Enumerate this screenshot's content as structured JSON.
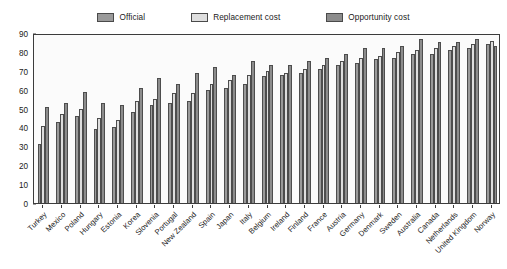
{
  "legend": {
    "position": "top-center",
    "items": [
      {
        "label": "Official",
        "color": "#9a9a9a",
        "key": "official"
      },
      {
        "label": "Replacement cost",
        "color": "#dedede",
        "key": "replacement_cost"
      },
      {
        "label": "Opportunity cost",
        "color": "#8c8c8c",
        "key": "opportunity_cost"
      }
    ]
  },
  "axes": {
    "y_ticks": [
      "0",
      "10",
      "20",
      "30",
      "40",
      "50",
      "60",
      "70",
      "80",
      "90"
    ],
    "y_min": 0,
    "y_max": 90,
    "y_step": 10,
    "grid": false
  },
  "chart_data": {
    "type": "bar",
    "title": "",
    "subtitle": "",
    "xlabel": "",
    "ylabel": "",
    "ylim": [
      0,
      90
    ],
    "grid": false,
    "legend_position": "top-center",
    "categories": [
      "Turkey",
      "Mexico",
      "Poland",
      "Hungary",
      "Estonia",
      "Korea",
      "Slovenia",
      "Portugal",
      "New Zealand",
      "Spain",
      "Japan",
      "Italy",
      "Belgium",
      "Ireland",
      "Finland",
      "France",
      "Austria",
      "Germany",
      "Denmark",
      "Sweden",
      "Australia",
      "Canada",
      "Netherlands",
      "United Kingdom",
      "Norway"
    ],
    "series": [
      {
        "name": "Official",
        "color": "#9a9a9a",
        "values": [
          31,
          43,
          46,
          39,
          40,
          48,
          52,
          53,
          54,
          60,
          61,
          63,
          67,
          68,
          69,
          71,
          73,
          74,
          76,
          77,
          79,
          79,
          81,
          82,
          84
        ]
      },
      {
        "name": "Replacement cost",
        "color": "#dedede",
        "values": [
          41,
          47,
          50,
          45,
          44,
          54,
          55,
          58,
          58,
          63,
          65,
          68,
          70,
          69,
          71,
          73,
          75,
          77,
          78,
          80,
          81,
          82,
          83,
          84,
          86
        ]
      },
      {
        "name": "Opportunity cost",
        "color": "#8c8c8c",
        "values": [
          51,
          53,
          59,
          53,
          52,
          61,
          66,
          63,
          69,
          72,
          68,
          75,
          73,
          73,
          75,
          77,
          79,
          82,
          82,
          83,
          87,
          85,
          85,
          87,
          83
        ]
      }
    ]
  }
}
